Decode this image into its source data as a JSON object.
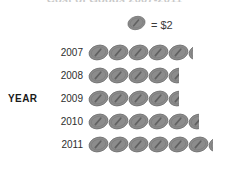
{
  "title": "Cost of Goods 2007-2011",
  "axis": {
    "y_label": "YEAR"
  },
  "legend": {
    "icon_name": "coin-icon",
    "text": "= $2"
  },
  "colors": {
    "icon_fill": "#8c8c8c",
    "icon_stroke": "#6f6f6f",
    "icon_highlight": "#5a5a5a",
    "label_text": "#2e2e2e",
    "axis_text": "#1a1a1a",
    "background": "#ffffff"
  },
  "chart_data": {
    "type": "bar",
    "chart_style": "pictograph",
    "title": "Cost of Goods 2007-2011",
    "xlabel": "",
    "ylabel": "YEAR",
    "icon_unit_value": 2,
    "unit": "$",
    "legend": [
      "= $2"
    ],
    "categories": [
      "2007",
      "2008",
      "2009",
      "2010",
      "2011"
    ],
    "icon_counts": [
      5.25,
      4.5,
      4.5,
      5.5,
      6.25
    ],
    "values": [
      10.5,
      9,
      9,
      11,
      12.5
    ],
    "grid": false,
    "legend_position": "top-right"
  },
  "rows": [
    {
      "label": "2007",
      "full": 5,
      "partial": 0.25
    },
    {
      "label": "2008",
      "full": 4,
      "partial": 0.5
    },
    {
      "label": "2009",
      "full": 4,
      "partial": 0.5
    },
    {
      "label": "2010",
      "full": 5,
      "partial": 0.5
    },
    {
      "label": "2011",
      "full": 6,
      "partial": 0.25
    }
  ]
}
